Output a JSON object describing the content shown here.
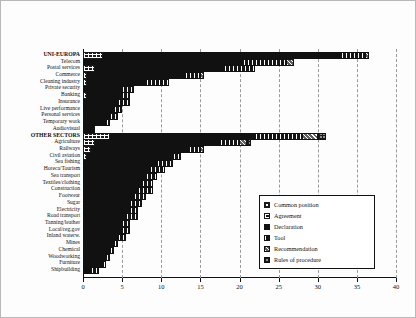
{
  "chart_data": {
    "type": "bar",
    "orientation": "horizontal",
    "stacked": true,
    "title": "",
    "subtitle": "",
    "xlabel": "",
    "ylabel": "",
    "xlim": [
      0,
      40
    ],
    "xticks": [
      0,
      5,
      10,
      15,
      20,
      25,
      30,
      35,
      40
    ],
    "xticklabels": [
      "0",
      "5",
      "10",
      "15",
      "20",
      "25",
      "30",
      "35",
      "40"
    ],
    "grid": true,
    "grid_axis": "x",
    "grid_style": "dashed",
    "legend_position": "inside-right-lower",
    "series": [
      {
        "name": "Common position",
        "key": "s0",
        "values": [
          0,
          0,
          0,
          0,
          0,
          0,
          0,
          0,
          0,
          0,
          0,
          0,
          0,
          0,
          0,
          0,
          0,
          0,
          0,
          0,
          0,
          0,
          0,
          0,
          0,
          0,
          0,
          0,
          0,
          0,
          0,
          0,
          0
        ]
      },
      {
        "name": "Agreement",
        "key": "s1",
        "values": [
          2.5,
          0,
          1.5,
          0.5,
          0.5,
          0,
          0.5,
          0,
          0,
          0,
          0,
          0,
          3.5,
          1.5,
          1,
          0.5,
          0,
          0,
          0,
          0,
          0,
          0,
          0,
          0,
          0,
          0,
          0,
          0,
          0,
          0,
          0,
          0,
          0
        ]
      },
      {
        "name": "Declaration",
        "key": "s2",
        "values": [
          30.5,
          20.5,
          16.5,
          12.5,
          7.5,
          5.0,
          4.5,
          4.5,
          4.0,
          3.5,
          3.0,
          1.5,
          18.5,
          16.0,
          12.5,
          11.0,
          9.5,
          8.5,
          8.0,
          7.5,
          7.0,
          6.5,
          6.0,
          6.0,
          5.5,
          5.0,
          5.0,
          4.5,
          4.0,
          3.5,
          3.0,
          2.5,
          1.0
        ]
      },
      {
        "name": "Tool",
        "key": "s3",
        "values": [
          3.0,
          5.5,
          4.0,
          2.0,
          3.0,
          1.5,
          1.0,
          1.5,
          1.0,
          1.0,
          0.5,
          0,
          6.0,
          2.5,
          1.5,
          1.0,
          2.0,
          2.0,
          1.5,
          1.5,
          2.0,
          1.5,
          1.5,
          1.0,
          1.5,
          1.0,
          1.0,
          1.0,
          0.5,
          0.5,
          0.5,
          0.5,
          1.0
        ]
      },
      {
        "name": "Recommendation",
        "key": "s4",
        "values": [
          0.5,
          1.0,
          0,
          0.5,
          0,
          0,
          0,
          0,
          0,
          0,
          0,
          0,
          2.0,
          1.0,
          0.5,
          0,
          0,
          0,
          0,
          0,
          0,
          0,
          0,
          0,
          0,
          0,
          0,
          0,
          0,
          0,
          0,
          0,
          0
        ]
      },
      {
        "name": "Rules of procedure",
        "key": "s5",
        "values": [
          0,
          0,
          0,
          0,
          0,
          0,
          0,
          0,
          0,
          0,
          0,
          0,
          1.0,
          0.5,
          0,
          0,
          0,
          0,
          0,
          0,
          0,
          0,
          0,
          0,
          0,
          0,
          0,
          0,
          0,
          0,
          0,
          0,
          0
        ]
      }
    ],
    "categories": [
      "UNI-EUROPA",
      "Telecom",
      "Postal services",
      "Commerce",
      "Cleaning industry",
      "Private security",
      "Banking",
      "Insurance",
      "Live performance",
      "Personal services",
      "Temporary work",
      "Audiovisual",
      "OTHER SECTORS",
      "Agriculture",
      "Railways",
      "Civil aviation",
      "Sea fishing",
      "Horeca/Tourism",
      "Sea transport",
      "Textiles/clothing",
      "Construction",
      "Footwear",
      "Sugar",
      "Electricity",
      "Road transport",
      "Tanning/leather",
      "Local/reg.gov",
      "Inland waterw.",
      "Mines",
      "Chemical",
      "Woodworking",
      "Furniture",
      "Shipbuilding"
    ],
    "header_categories": [
      "UNI-EUROPA",
      "OTHER SECTORS"
    ],
    "totals": [
      36.5,
      27.0,
      22.0,
      15.5,
      11.0,
      6.5,
      6.0,
      6.0,
      5.0,
      4.5,
      3.5,
      1.5,
      31.0,
      21.5,
      14.5,
      12.5,
      11.5,
      10.5,
      9.5,
      9.0,
      9.0,
      8.0,
      7.5,
      7.0,
      7.0,
      6.0,
      6.0,
      5.5,
      4.5,
      4.0,
      3.5,
      3.0,
      2.0
    ]
  },
  "legend": {
    "items": [
      {
        "label": "Common position",
        "key": "s0"
      },
      {
        "label": "Agreement",
        "key": "s1"
      },
      {
        "label": "Declaration",
        "key": "s2"
      },
      {
        "label": "Tool",
        "key": "s3"
      },
      {
        "label": "Recommendation",
        "key": "s4"
      },
      {
        "label": "Rules of procedure",
        "key": "s5"
      }
    ]
  },
  "colors": {
    "axis": "#111111",
    "grid": "#9a9a9a",
    "background": "#ffffff",
    "frame": "#b9b9b9",
    "series": [
      "#ffffff",
      "#1a1a1a",
      "#111111",
      "#151515",
      "#5e5e5e",
      "#8d8d8d"
    ]
  }
}
